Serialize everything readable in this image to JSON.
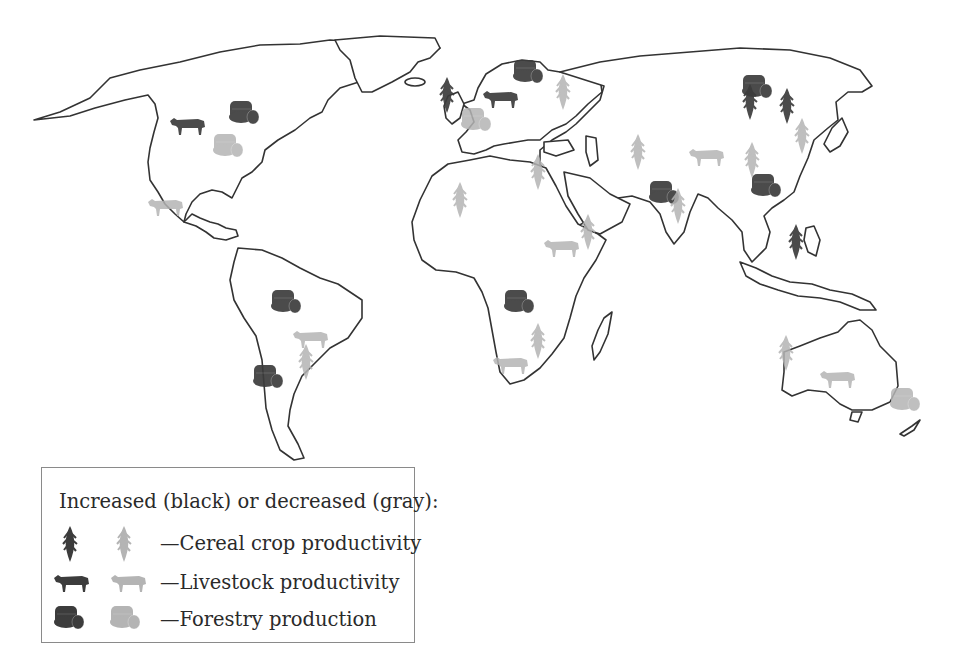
{
  "colors": {
    "increased": "#3c3c3c",
    "decreased": "#b4b4b4",
    "coastline": "#333333",
    "background": "#ffffff"
  },
  "legend": {
    "title": "Increased (black) or decreased (gray):",
    "items": [
      {
        "symbol": "cereal-icon",
        "label": "—Cereal crop productivity"
      },
      {
        "symbol": "livestock-icon",
        "label": "—Livestock productivity"
      },
      {
        "symbol": "forestry-icon",
        "label": "—Forestry production"
      }
    ]
  },
  "markers": [
    {
      "region": "Canada",
      "type": "livestock",
      "trend": "increased",
      "x": 188,
      "y": 125
    },
    {
      "region": "Eastern Canada",
      "type": "forestry",
      "trend": "increased",
      "x": 244,
      "y": 113
    },
    {
      "region": "Eastern USA",
      "type": "forestry",
      "trend": "decreased",
      "x": 228,
      "y": 146
    },
    {
      "region": "Mexico",
      "type": "livestock",
      "trend": "decreased",
      "x": 166,
      "y": 206
    },
    {
      "region": "Brazil (Amazon)",
      "type": "forestry",
      "trend": "increased",
      "x": 286,
      "y": 302
    },
    {
      "region": "Southern Brazil",
      "type": "livestock",
      "trend": "decreased",
      "x": 311,
      "y": 338
    },
    {
      "region": "Argentina",
      "type": "cereal",
      "trend": "decreased",
      "x": 306,
      "y": 362
    },
    {
      "region": "Chile/Argentina",
      "type": "forestry",
      "trend": "increased",
      "x": 268,
      "y": 377
    },
    {
      "region": "British Isles",
      "type": "cereal",
      "trend": "increased",
      "x": 447,
      "y": 95
    },
    {
      "region": "Central Europe",
      "type": "forestry",
      "trend": "decreased",
      "x": 476,
      "y": 120
    },
    {
      "region": "Northern Europe",
      "type": "livestock",
      "trend": "increased",
      "x": 501,
      "y": 98
    },
    {
      "region": "Scandinavia/Russia",
      "type": "forestry",
      "trend": "increased",
      "x": 528,
      "y": 72
    },
    {
      "region": "Western Russia",
      "type": "cereal",
      "trend": "decreased",
      "x": 563,
      "y": 92
    },
    {
      "region": "Middle East",
      "type": "cereal",
      "trend": "decreased",
      "x": 538,
      "y": 172
    },
    {
      "region": "West Africa",
      "type": "cereal",
      "trend": "decreased",
      "x": 460,
      "y": 200
    },
    {
      "region": "Horn of Africa",
      "type": "livestock",
      "trend": "decreased",
      "x": 562,
      "y": 247
    },
    {
      "region": "East Africa",
      "type": "cereal",
      "trend": "decreased",
      "x": 588,
      "y": 232
    },
    {
      "region": "Central Africa",
      "type": "forestry",
      "trend": "increased",
      "x": 519,
      "y": 302
    },
    {
      "region": "Southern Africa",
      "type": "livestock",
      "trend": "decreased",
      "x": 511,
      "y": 364
    },
    {
      "region": "Southern Africa",
      "type": "cereal",
      "trend": "decreased",
      "x": 538,
      "y": 341
    },
    {
      "region": "Central Asia",
      "type": "cereal",
      "trend": "decreased",
      "x": 638,
      "y": 152
    },
    {
      "region": "India",
      "type": "forestry",
      "trend": "increased",
      "x": 664,
      "y": 193
    },
    {
      "region": "India",
      "type": "cereal",
      "trend": "decreased",
      "x": 678,
      "y": 206
    },
    {
      "region": "China (west)",
      "type": "livestock",
      "trend": "decreased",
      "x": 707,
      "y": 156
    },
    {
      "region": "China",
      "type": "cereal",
      "trend": "decreased",
      "x": 752,
      "y": 160
    },
    {
      "region": "Southern China",
      "type": "forestry",
      "trend": "increased",
      "x": 766,
      "y": 186
    },
    {
      "region": "Siberia",
      "type": "forestry",
      "trend": "increased",
      "x": 757,
      "y": 87
    },
    {
      "region": "Siberia",
      "type": "cereal",
      "trend": "increased",
      "x": 750,
      "y": 102
    },
    {
      "region": "Far East Russia",
      "type": "cereal",
      "trend": "increased",
      "x": 787,
      "y": 106
    },
    {
      "region": "Northeast China",
      "type": "cereal",
      "trend": "decreased",
      "x": 802,
      "y": 136
    },
    {
      "region": "Southeast Asia",
      "type": "cereal",
      "trend": "increased",
      "x": 796,
      "y": 242
    },
    {
      "region": "Western Australia",
      "type": "cereal",
      "trend": "decreased",
      "x": 786,
      "y": 353
    },
    {
      "region": "Southern Australia",
      "type": "livestock",
      "trend": "decreased",
      "x": 838,
      "y": 378
    },
    {
      "region": "New Zealand",
      "type": "forestry",
      "trend": "decreased",
      "x": 905,
      "y": 400
    }
  ]
}
